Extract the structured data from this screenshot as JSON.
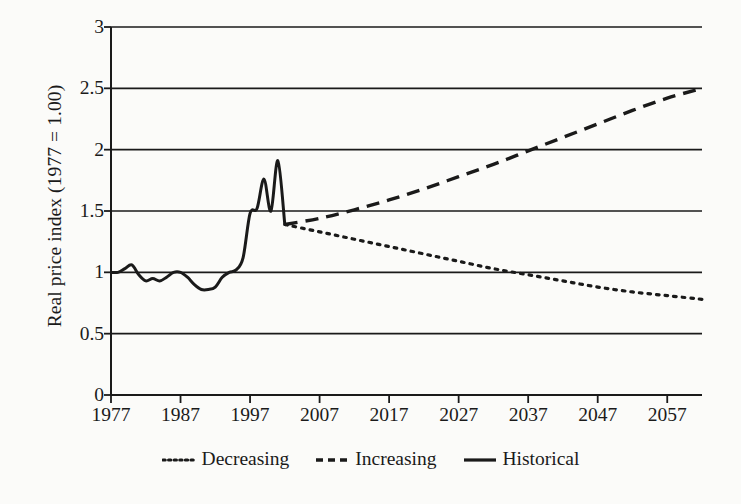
{
  "figure": {
    "background_color": "#fbfbf9",
    "ink_color": "#1a1a1a"
  },
  "chart_data": {
    "type": "line",
    "title": "",
    "xlabel": "",
    "ylabel": "Real price index (1977 = 1.00)",
    "xlim": [
      1977,
      2062
    ],
    "ylim": [
      0,
      3
    ],
    "grid": true,
    "grid_axis": "y",
    "legend_position": "bottom-center",
    "xticks": [
      1977,
      1987,
      1997,
      2007,
      2017,
      2027,
      2037,
      2047,
      2057
    ],
    "xtick_labels": [
      "1977",
      "1987",
      "1997",
      "2007",
      "2017",
      "2027",
      "2037",
      "2047",
      "2057"
    ],
    "yticks": [
      0,
      0.5,
      1,
      1.5,
      2,
      2.5,
      3
    ],
    "ytick_labels": [
      "0",
      "0.5",
      "1",
      "1.5",
      "2",
      "2.5",
      "3"
    ],
    "series": [
      {
        "name": "Historical",
        "style": "solid",
        "color": "#1a1a1a",
        "x": [
          1977,
          1978,
          1979,
          1980,
          1981,
          1982,
          1983,
          1984,
          1985,
          1986,
          1987,
          1988,
          1989,
          1990,
          1991,
          1992,
          1993,
          1994,
          1995,
          1996,
          1997,
          1998,
          1999,
          2000,
          2001,
          2002
        ],
        "values": [
          1.0,
          1.0,
          1.03,
          1.06,
          0.98,
          0.93,
          0.95,
          0.93,
          0.96,
          1.0,
          1.0,
          0.96,
          0.9,
          0.86,
          0.86,
          0.88,
          0.96,
          1.0,
          1.02,
          1.12,
          1.48,
          1.52,
          1.76,
          1.5,
          1.91,
          1.39
        ]
      },
      {
        "name": "Increasing",
        "style": "dashed",
        "color": "#1a1a1a",
        "x": [
          2002,
          2007,
          2012,
          2017,
          2022,
          2027,
          2032,
          2037,
          2042,
          2047,
          2052,
          2057,
          2062
        ],
        "values": [
          1.39,
          1.44,
          1.51,
          1.59,
          1.68,
          1.78,
          1.88,
          1.99,
          2.1,
          2.21,
          2.32,
          2.42,
          2.5
        ]
      },
      {
        "name": "Decreasing",
        "style": "dotted",
        "color": "#1a1a1a",
        "x": [
          2002,
          2007,
          2012,
          2017,
          2022,
          2027,
          2032,
          2037,
          2042,
          2047,
          2052,
          2057,
          2062
        ],
        "values": [
          1.39,
          1.33,
          1.27,
          1.21,
          1.15,
          1.09,
          1.03,
          0.98,
          0.93,
          0.88,
          0.84,
          0.81,
          0.78
        ]
      }
    ],
    "legend": [
      {
        "label": "Decreasing",
        "style": "dotted"
      },
      {
        "label": "Increasing",
        "style": "dashed"
      },
      {
        "label": "Historical",
        "style": "solid"
      }
    ]
  }
}
